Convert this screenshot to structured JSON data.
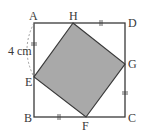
{
  "diagram": {
    "type": "geometry",
    "colors": {
      "outline": "#3a3a3a",
      "shaded_fill": "#a9a9a9",
      "background": "#ffffff"
    },
    "points": {
      "A": {
        "label": "A"
      },
      "B": {
        "label": "B"
      },
      "C": {
        "label": "C"
      },
      "D": {
        "label": "D"
      },
      "E": {
        "label": "E"
      },
      "F": {
        "label": "F"
      },
      "G": {
        "label": "G"
      },
      "H": {
        "label": "H"
      }
    },
    "measurement": {
      "segment": "AE",
      "label": "4 cm"
    },
    "equal_marks": [
      "AE",
      "HD",
      "GC",
      "BF"
    ]
  }
}
